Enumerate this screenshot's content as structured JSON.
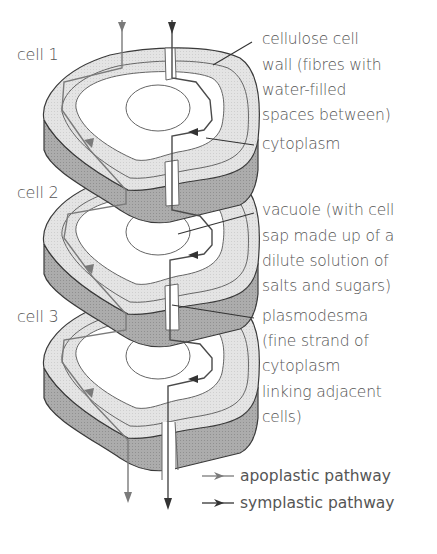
{
  "figure": {
    "cell_labels": [
      "cell 1",
      "cell 2",
      "cell 3"
    ],
    "annotations": {
      "cell_wall": [
        "cellulose cell",
        "wall (fibres with",
        "water-filled",
        "spaces between)"
      ],
      "cytoplasm": [
        "cytoplasm"
      ],
      "vacuole": [
        "vacuole (with cell",
        "sap made up of a",
        "dilute solution of",
        "salts and sugars)"
      ],
      "plasmodesma": [
        "plasmodesma",
        "(fine strand of",
        "cytoplasm",
        "linking adjacent",
        "cells)"
      ]
    },
    "legend": [
      {
        "label": "apoplastic pathway",
        "arrow_color": "#7a7a7a",
        "icon": "apoplastic-arrow-icon"
      },
      {
        "label": "symplastic pathway",
        "arrow_color": "#333333",
        "icon": "symplastic-arrow-icon"
      }
    ],
    "colors": {
      "wall_light": "#e2e2e2",
      "wall_side_dark": "#a8a8a8",
      "cytoplasm_fill": "#ffffff",
      "outline": "#3a3a3a",
      "line_gray": "#777777"
    }
  }
}
